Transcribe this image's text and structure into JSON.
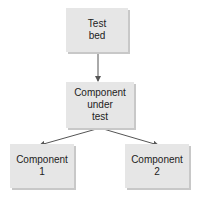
{
  "diagram": {
    "nodes": [
      {
        "id": "test-bed",
        "label": "Test\nbed"
      },
      {
        "id": "component-under-test",
        "label": "Component\nunder\ntest"
      },
      {
        "id": "component-1",
        "label": "Component\n1"
      },
      {
        "id": "component-2",
        "label": "Component\n2"
      }
    ],
    "edges": [
      {
        "from": "test-bed",
        "to": "component-under-test"
      },
      {
        "from": "component-under-test",
        "to": "component-1"
      },
      {
        "from": "component-under-test",
        "to": "component-2"
      }
    ],
    "colors": {
      "box_fill": "#e6e6e6",
      "box_shadow": "#c8c8c8",
      "line": "#555555"
    }
  }
}
